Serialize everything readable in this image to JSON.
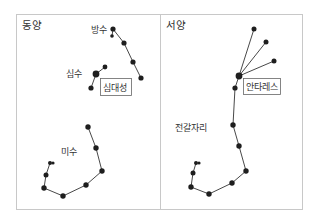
{
  "panels": [
    {
      "title": "동양",
      "labels": [
        {
          "text": "방수",
          "x": 91,
          "y": 33
        },
        {
          "text": "심수",
          "x": 66,
          "y": 72
        },
        {
          "text": "미수",
          "x": 61,
          "y": 154
        }
      ],
      "boxed_labels": [
        {
          "text": "심대성",
          "x": 100,
          "y": 78,
          "w": 32,
          "h": 17
        }
      ]
    },
    {
      "title": "서양",
      "labels": [
        {
          "text": "전갈자리",
          "x": 175,
          "y": 131
        }
      ],
      "boxed_labels": [
        {
          "text": "안타레스",
          "x": 243,
          "y": 78,
          "w": 38,
          "h": 17
        }
      ]
    }
  ],
  "colors": {
    "frame": "#c8c8c8",
    "star": "#1e1e1e",
    "line": "#333333",
    "text": "#333333"
  }
}
